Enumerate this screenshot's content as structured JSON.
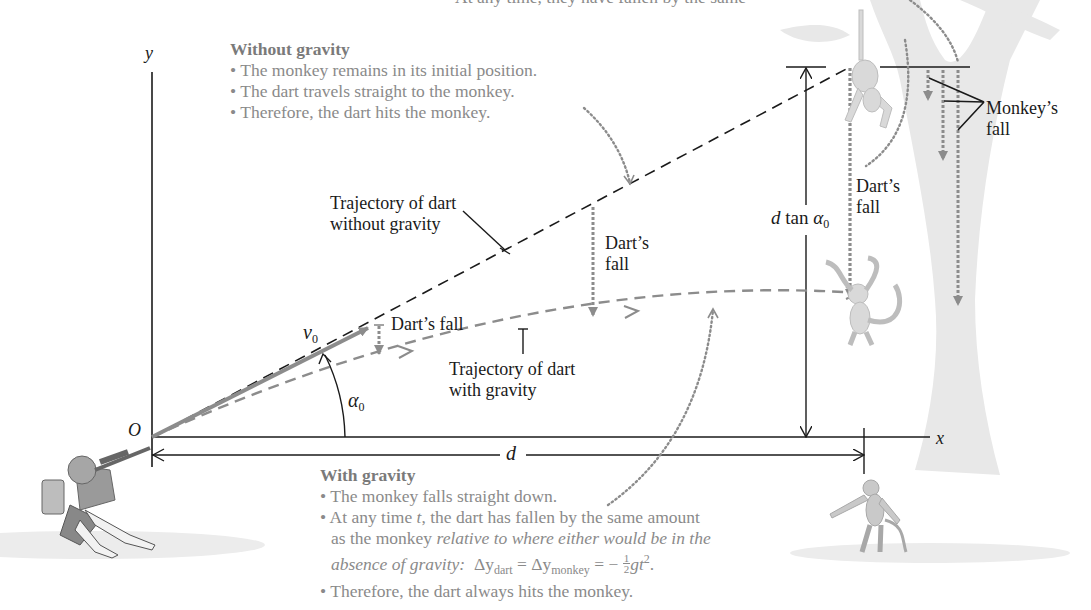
{
  "top_caption_partial": "At any time, they have fallen by the same",
  "axes": {
    "y_label": "y",
    "x_label": "x",
    "origin_label": "O"
  },
  "without_gravity_note": {
    "heading": "Without gravity",
    "bullets": [
      "• The monkey remains in its initial position.",
      "• The dart travels straight to the monkey.",
      "• Therefore, the dart hits the monkey."
    ]
  },
  "with_gravity_note": {
    "heading": "With gravity",
    "bullet1": "• The monkey falls straight down.",
    "bullet2_prefix": "• At any time ",
    "bullet2_var": "t",
    "bullet2_suffix": ", the dart has fallen by the same amount",
    "bullet2_line2_plain": "as the monkey ",
    "bullet2_line2_italic": "relative to where either would be in the",
    "bullet2_line3_italic": "absence of gravity:",
    "equation": {
      "delta_y": "Δy",
      "sub_dart": "dart",
      "sub_monkey": "monkey",
      "equals": "=",
      "minus": "−",
      "frac_num": "1",
      "frac_den": "2",
      "gt": "gt",
      "exp": "2",
      "end": "."
    },
    "bullet3": "• Therefore, the dart always hits the monkey."
  },
  "labels": {
    "traj_without_line1": "Trajectory of dart",
    "traj_without_line2": "without gravity",
    "traj_with_line1": "Trajectory of dart",
    "traj_with_line2": "with gravity",
    "darts_fall_small": "Dart’s fall",
    "darts_fall_mid_line1": "Dart’s",
    "darts_fall_mid_line2": "fall",
    "darts_fall_right_line1": "Dart’s",
    "darts_fall_right_line2": "fall",
    "monkeys_fall_line1": "Monkey’s",
    "monkeys_fall_line2": "fall",
    "v0": "v",
    "v0_sub": "0",
    "alpha0": "α",
    "alpha0_sub": "0",
    "d": "d",
    "dtan_d": "d",
    "dtan_tan": " tan ",
    "dtan_alpha": "α",
    "dtan_sub": "0"
  },
  "colors": {
    "ink": "#1a1a1a",
    "grey_line": "#8c8c8c",
    "note_text": "#8a8a8a",
    "background_art": "#e6e6e6"
  }
}
